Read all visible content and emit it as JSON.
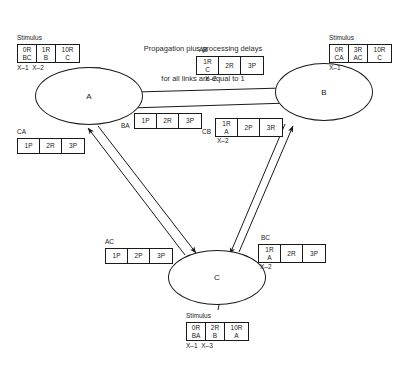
{
  "title": {
    "line1": "Propagation plus processing delays",
    "line2": "for all links are equal to 1"
  },
  "nodes": [
    {
      "id": "A",
      "label": "A"
    },
    {
      "id": "B",
      "label": "B"
    },
    {
      "id": "C",
      "label": "C"
    }
  ],
  "stimulus_label": "Stimulus",
  "stimuli": [
    {
      "name": "stimulus-a",
      "heading": "Stimulus",
      "cells": [
        {
          "top": "0R",
          "bottom": "BC"
        },
        {
          "top": "1R",
          "bottom": "B"
        },
        {
          "top": "10R",
          "bottom": "C"
        }
      ],
      "times": "X–1  X–2"
    },
    {
      "name": "stimulus-b",
      "heading": "Stimulus",
      "cells": [
        {
          "top": "0R",
          "bottom": "CA"
        },
        {
          "top": "3R",
          "bottom": "AC"
        },
        {
          "top": "10R",
          "bottom": "C"
        }
      ],
      "times": "X–1"
    },
    {
      "name": "stimulus-c",
      "heading": "Stimulus",
      "cells": [
        {
          "top": "0R",
          "bottom": "BA"
        },
        {
          "top": "2R",
          "bottom": "B"
        },
        {
          "top": "10R",
          "bottom": "A"
        }
      ],
      "times": "X–1  X–3"
    }
  ],
  "links": [
    {
      "name": "link-ab",
      "label": "AB",
      "cells": [
        {
          "top": "1R",
          "bottom": "C"
        },
        {
          "top": "2R",
          "bottom": ""
        },
        {
          "top": "3P",
          "bottom": ""
        }
      ],
      "times": "X–2"
    },
    {
      "name": "link-ba",
      "label": "BA",
      "cells": [
        {
          "top": "1P",
          "bottom": ""
        },
        {
          "top": "2R",
          "bottom": ""
        },
        {
          "top": "3P",
          "bottom": ""
        }
      ],
      "times": ""
    },
    {
      "name": "link-cb",
      "label": "CB",
      "cells": [
        {
          "top": "1R",
          "bottom": "A"
        },
        {
          "top": "2P",
          "bottom": ""
        },
        {
          "top": "3R",
          "bottom": ""
        }
      ],
      "times": "X–2"
    },
    {
      "name": "link-ca",
      "label": "CA",
      "cells": [
        {
          "top": "1P",
          "bottom": ""
        },
        {
          "top": "2R",
          "bottom": ""
        },
        {
          "top": "3P",
          "bottom": ""
        }
      ],
      "times": ""
    },
    {
      "name": "link-ac",
      "label": "AC",
      "cells": [
        {
          "top": "1P",
          "bottom": ""
        },
        {
          "top": "2P",
          "bottom": ""
        },
        {
          "top": "3P",
          "bottom": ""
        }
      ],
      "times": ""
    },
    {
      "name": "link-bc",
      "label": "BC",
      "cells": [
        {
          "top": "1R",
          "bottom": "A"
        },
        {
          "top": "2R",
          "bottom": ""
        },
        {
          "top": "3P",
          "bottom": ""
        }
      ],
      "times": "X–2"
    }
  ],
  "colors": {
    "stroke": "#1a1a1a",
    "background": "#ffffff",
    "text": "#1a1a1a"
  }
}
